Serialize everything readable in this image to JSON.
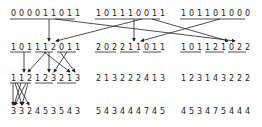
{
  "diagram": {
    "colors": {
      "ink": "#222222",
      "background": "#ffffff"
    },
    "rows": [
      {
        "id": "row1",
        "y": 10,
        "groups": [
          {
            "x": 11,
            "text": "000011011"
          },
          {
            "x": 96,
            "text": "101110011"
          },
          {
            "x": 181,
            "text": "101101000"
          }
        ]
      },
      {
        "id": "row2",
        "y": 44,
        "groups": [
          {
            "x": 11,
            "text": "101112011"
          },
          {
            "x": 96,
            "text": "202211011"
          },
          {
            "x": 181,
            "text": "101121022"
          }
        ]
      },
      {
        "id": "row3",
        "y": 75,
        "groups": [
          {
            "x": 11,
            "text": "112123213"
          },
          {
            "x": 96,
            "text": "213222413"
          },
          {
            "x": 181,
            "text": "123143222"
          }
        ]
      },
      {
        "id": "row4",
        "y": 108,
        "groups": [
          {
            "x": 11,
            "text": "332453543"
          },
          {
            "x": 96,
            "text": "543444745"
          },
          {
            "x": 181,
            "text": "453475444"
          }
        ]
      }
    ]
  }
}
